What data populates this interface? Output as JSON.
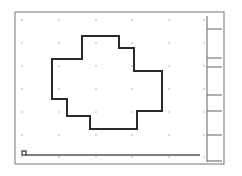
{
  "canvas": {
    "width": 242,
    "height": 176,
    "background": "#ffffff",
    "frame": {
      "x": 15,
      "y": 12,
      "width": 209,
      "height": 152,
      "stroke": "#8a8a8a",
      "stroke_width": 1.2
    }
  },
  "dot_grid": {
    "columns": [
      22,
      59,
      96,
      132,
      169,
      204
    ],
    "rows": [
      20,
      43,
      66,
      89,
      112,
      135,
      157
    ],
    "dot_color": "#9a9a9a",
    "dot_radius": 0.7
  },
  "shape": {
    "name": "cross-polygon",
    "stroke": "#2a2a2a",
    "stroke_width": 2,
    "points": [
      [
        82,
        36
      ],
      [
        119,
        36
      ],
      [
        119,
        48
      ],
      [
        134,
        48
      ],
      [
        134,
        71
      ],
      [
        162,
        71
      ],
      [
        162,
        111
      ],
      [
        137,
        111
      ],
      [
        137,
        129
      ],
      [
        90,
        129
      ],
      [
        90,
        116
      ],
      [
        67,
        116
      ],
      [
        67,
        99
      ],
      [
        52,
        99
      ],
      [
        52,
        59
      ],
      [
        82,
        59
      ]
    ]
  },
  "side_panel": {
    "line_x": 207,
    "y_top": 16,
    "y_bottom": 162,
    "tick_x2": 222,
    "ticks": [
      29,
      58,
      67,
      95,
      111,
      135,
      161
    ],
    "stroke": "#7a7a7a"
  },
  "bottom_slider": {
    "handle": {
      "x": 22,
      "y": 151,
      "size": 4
    },
    "track": {
      "x1": 26,
      "x2": 200,
      "y": 155
    },
    "stroke": "#555555"
  }
}
